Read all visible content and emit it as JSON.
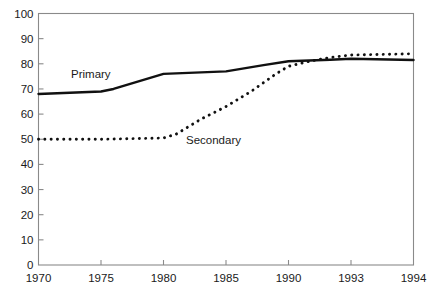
{
  "chart_data": {
    "type": "line",
    "title": "",
    "subtitle": "",
    "xlabel": "",
    "ylabel": "",
    "xlim": [
      1970,
      1994
    ],
    "ylim": [
      0,
      100
    ],
    "grid": false,
    "legend_position": "inline-annotation",
    "x_tick_labels": [
      "1970",
      "1975",
      "1980",
      "1985",
      "1990",
      "1993",
      "1994"
    ],
    "x_tick_values": [
      1970,
      1975,
      1980,
      1985,
      1990,
      1993,
      1994
    ],
    "y_tick_labels": [
      "0",
      "10",
      "20",
      "30",
      "40",
      "50",
      "60",
      "70",
      "80",
      "90",
      "100"
    ],
    "y_tick_values": [
      0,
      10,
      20,
      30,
      40,
      50,
      60,
      70,
      80,
      90,
      100
    ],
    "annotations": [
      {
        "text": "Primary",
        "x": 1972.6,
        "y": 74.5
      },
      {
        "text": "Secondary",
        "x": 1981.8,
        "y": 48.0
      }
    ],
    "series": [
      {
        "name": "Primary",
        "style": "solid",
        "color": "#111111",
        "x": [
          1970,
          1975,
          1976,
          1980,
          1985,
          1988,
          1990,
          1991,
          1992,
          1993,
          1994
        ],
        "values": [
          68,
          69,
          70,
          76,
          77,
          79.5,
          81,
          81.3,
          81.6,
          82,
          81.5
        ]
      },
      {
        "name": "Secondary",
        "style": "dotted",
        "color": "#111111",
        "x": [
          1970,
          1975,
          1980,
          1981,
          1982,
          1983,
          1985,
          1987,
          1989,
          1990,
          1991,
          1992,
          1993,
          1994
        ],
        "values": [
          50,
          50,
          50.5,
          52,
          55,
          58,
          63,
          69,
          76,
          79,
          81,
          82.5,
          83.5,
          84
        ]
      }
    ]
  },
  "axis": {
    "y_axis_name": "value-axis",
    "x_axis_name": "year-axis"
  }
}
